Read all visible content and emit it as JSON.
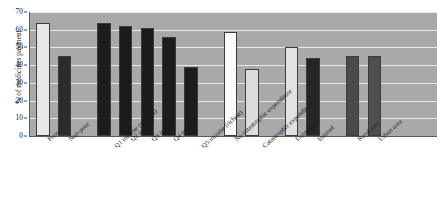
{
  "chart_data": {
    "type": "bar",
    "title": "",
    "xlabel": "",
    "ylabel": "% of medicines payment",
    "ylim": [
      0,
      70
    ],
    "yticks": [
      0,
      10,
      20,
      30,
      40,
      50,
      60,
      70
    ],
    "grid": true,
    "legend": "none",
    "categories": [
      "Poor",
      "Non-poor",
      "Q1 income (poorest)",
      "Q2 income",
      "Q3 income",
      "Q4 income",
      "Q5 income (richest)",
      "No catastrophic expenditure",
      "Catastrophic expenditure",
      "Uninsured",
      "Insured",
      "Rural area",
      "Urban area"
    ],
    "values": [
      64,
      45,
      64,
      62,
      61,
      56,
      39,
      59,
      38,
      50,
      44,
      45,
      45
    ],
    "bar_colors": [
      "#e8e8e8",
      "#2b2b2b",
      "#1c1c1c",
      "#1c1c1c",
      "#1c1c1c",
      "#1c1c1c",
      "#1c1c1c",
      "#fbfbfb",
      "#dcdcdc",
      "#e2e2e2",
      "#262626",
      "#4a4a4a",
      "#4f4f4f"
    ],
    "groups": [
      {
        "name": "poverty",
        "indices": [
          0,
          1
        ]
      },
      {
        "name": "income-quintiles",
        "indices": [
          2,
          3,
          4,
          5,
          6
        ]
      },
      {
        "name": "catastrophic-expenditure",
        "indices": [
          7,
          8
        ]
      },
      {
        "name": "insurance-status",
        "indices": [
          9,
          10
        ]
      },
      {
        "name": "area-of-residence",
        "indices": [
          11,
          12
        ]
      }
    ],
    "plot_background": "#a9a9a9",
    "gridline_color": "#efefef"
  },
  "caption": {
    "text": ""
  }
}
